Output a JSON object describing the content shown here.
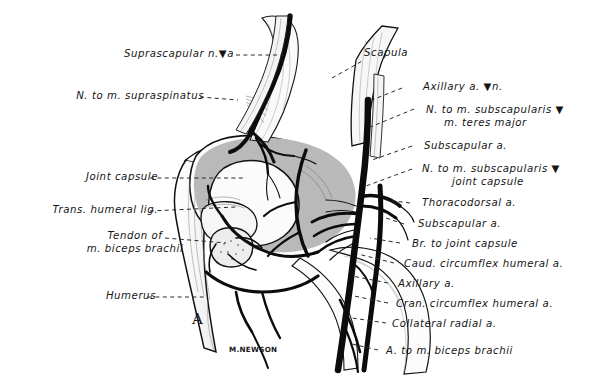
{
  "figure": {
    "panel_letter": "A",
    "signature": "M.NEWSON",
    "gray_fill": "#b9b9b9",
    "ink": "#101010",
    "paper": "#ffffff"
  },
  "labels_left": [
    {
      "id": "suprascapular-n-a",
      "text": "Suprascapular n.▼a"
    },
    {
      "id": "n-to-m-supraspinatus",
      "text": "N. to m. supraspinatus"
    },
    {
      "id": "joint-capsule",
      "text": "Joint capsule"
    },
    {
      "id": "trans-humeral-lig",
      "text": "Trans. humeral lig."
    },
    {
      "id": "tendon-of-m-biceps-brachii",
      "line1": "Tendon of",
      "line2": "m. biceps brachii"
    },
    {
      "id": "humerus",
      "text": "Humerus"
    }
  ],
  "labels_right": [
    {
      "id": "scapula",
      "text": "Scapula"
    },
    {
      "id": "axillary-a-n",
      "text": "Axillary a. ▼n."
    },
    {
      "id": "n-to-m-subscapularis-teres",
      "line1": "N. to m. subscapularis ▼",
      "line2": "m. teres major"
    },
    {
      "id": "subscapular-a-1",
      "text": "Subscapular a."
    },
    {
      "id": "n-to-m-subscapularis-capsule",
      "line1": "N. to m. subscapularis ▼",
      "line2": "joint capsule"
    },
    {
      "id": "thoracodorsal-a",
      "text": "Thoracodorsal a."
    },
    {
      "id": "subscapular-a-2",
      "text": "Subscapular a."
    },
    {
      "id": "br-to-joint-capsule",
      "text": "Br. to joint capsule"
    },
    {
      "id": "caud-circumflex-humeral-a",
      "text": "Caud. circumflex humeral a."
    },
    {
      "id": "axillary-a",
      "text": "Axillary a."
    },
    {
      "id": "cran-circumflex-humeral-a",
      "text": "Cran. circumflex humeral a."
    },
    {
      "id": "collateral-radial-a",
      "text": "Collateral radial a."
    },
    {
      "id": "a-to-m-biceps-brachii",
      "text": "A. to m. biceps brachii"
    }
  ]
}
